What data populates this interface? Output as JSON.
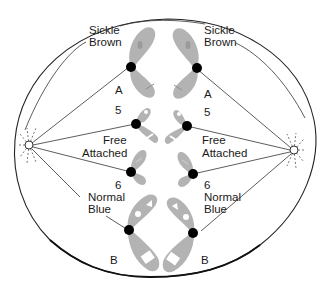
{
  "diagram": {
    "type": "cell division — chromosome pairing diagram with spindle fibers",
    "left_side": {
      "labels": {
        "top_gene_1": "Sickle",
        "top_gene_2": "Brown",
        "chromosome_A": "A",
        "chromosome_5": "5",
        "middle_gene_1": "Free",
        "middle_gene_2": "Attached",
        "chromosome_6": "6",
        "bottom_gene_1": "Normal",
        "bottom_gene_2": "Blue",
        "chromosome_B": "B"
      }
    },
    "right_side": {
      "labels": {
        "top_gene_1": "Sickle",
        "top_gene_2": "Brown",
        "chromosome_A": "A",
        "chromosome_5": "5",
        "middle_gene_1": "Free",
        "middle_gene_2": "Attached",
        "chromosome_6": "6",
        "bottom_gene_1": "Normal",
        "bottom_gene_2": "Blue",
        "chromosome_B": "B"
      }
    },
    "icons": {
      "left_pole": "centriole-aster",
      "right_pole": "centriole-aster",
      "centromere": "black-dot"
    },
    "colors": {
      "chromosome": "#b3b3b3",
      "centromere": "#000000",
      "outline": "#222222"
    }
  }
}
